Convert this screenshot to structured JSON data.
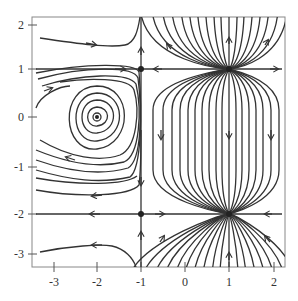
{
  "figure": {
    "type": "phase-portrait",
    "frame": {
      "left": 32,
      "top": 17,
      "right": 285,
      "bottom": 267
    },
    "stroke_color": "#333333",
    "frame_color": "#888888"
  },
  "axes": {
    "x_ticks": [
      {
        "value": -3,
        "label": "-3",
        "px": 54
      },
      {
        "value": -2,
        "label": "-2",
        "px": 97
      },
      {
        "value": -1,
        "label": "-1",
        "px": 141
      },
      {
        "value": 0,
        "label": "0",
        "px": 185
      },
      {
        "value": 1,
        "label": "1",
        "px": 229
      },
      {
        "value": 2,
        "label": "2",
        "px": 274
      }
    ],
    "y_ticks": [
      {
        "value": 2,
        "label": "2",
        "px": 25
      },
      {
        "value": 1,
        "label": "1",
        "px": 69
      },
      {
        "value": 0,
        "label": "0",
        "px": 117
      },
      {
        "value": -1,
        "label": "-1",
        "px": 167
      },
      {
        "value": -2,
        "label": "-2",
        "px": 214
      },
      {
        "value": -3,
        "label": "-3",
        "px": 254
      }
    ],
    "xlim": [
      -3.3,
      2.3
    ],
    "ylim": [
      -3.3,
      2.2
    ]
  },
  "equilibria": [
    {
      "x": -2,
      "y": 0,
      "kind": "center"
    },
    {
      "x": -1,
      "y": 1,
      "kind": "saddle"
    },
    {
      "x": -1,
      "y": -2,
      "kind": "saddle"
    },
    {
      "x": 1,
      "y": 1,
      "kind": "unstable-node"
    },
    {
      "x": 1,
      "y": -2,
      "kind": "stable-node"
    }
  ],
  "invariant_lines": {
    "vertical": [
      -1,
      1
    ],
    "horizontal": [
      1,
      -2
    ]
  }
}
